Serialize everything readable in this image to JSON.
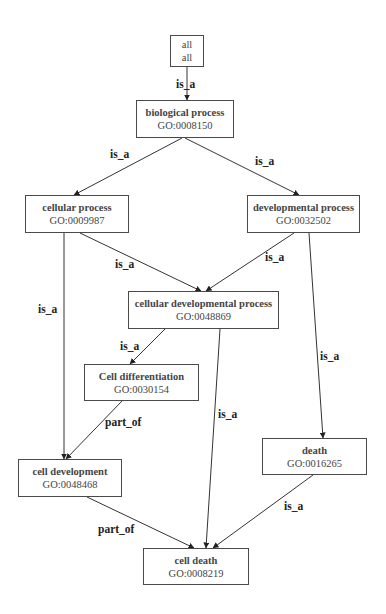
{
  "diagram": {
    "type": "GO term hierarchy graph",
    "nodes": [
      {
        "key": "all",
        "name": "all",
        "id": "all",
        "x": 170,
        "y": 35,
        "w": 34,
        "h": 32
      },
      {
        "key": "biological_process",
        "name": "biological process",
        "id": "GO:0008150",
        "x": 136,
        "y": 100,
        "w": 98,
        "h": 38
      },
      {
        "key": "cellular_process",
        "name": "cellular process",
        "id": "GO:0009987",
        "x": 25,
        "y": 195,
        "w": 104,
        "h": 38
      },
      {
        "key": "developmental_process",
        "name": "developmental process",
        "id": "GO:0032502",
        "x": 247,
        "y": 195,
        "w": 113,
        "h": 38
      },
      {
        "key": "cellular_developmental_process",
        "name": "cellular developmental process",
        "id": "GO:0048869",
        "x": 128,
        "y": 291,
        "w": 151,
        "h": 38
      },
      {
        "key": "cell_differentiation",
        "name": "Cell differentiation",
        "id": "GO:0030154",
        "x": 84,
        "y": 364,
        "w": 115,
        "h": 37
      },
      {
        "key": "cell_development",
        "name": "cell development",
        "id": "GO:0048468",
        "x": 18,
        "y": 459,
        "w": 104,
        "h": 38
      },
      {
        "key": "death",
        "name": "death",
        "id": "GO:0016265",
        "x": 262,
        "y": 438,
        "w": 105,
        "h": 37
      },
      {
        "key": "cell_death",
        "name": "cell death",
        "id": "GO:0008219",
        "x": 143,
        "y": 548,
        "w": 106,
        "h": 37
      }
    ],
    "edges": [
      {
        "from": "all",
        "to": "biological_process",
        "label": "is_a",
        "x1": 187,
        "y1": 67,
        "x2": 187,
        "y2": 100,
        "lx": 176,
        "ly": 78
      },
      {
        "from": "biological_process",
        "to": "cellular_process",
        "label": "is_a",
        "x1": 182,
        "y1": 138,
        "x2": 74,
        "y2": 195,
        "lx": 110,
        "ly": 148
      },
      {
        "from": "biological_process",
        "to": "developmental_process",
        "label": "is_a",
        "x1": 185,
        "y1": 138,
        "x2": 299,
        "y2": 195,
        "lx": 255,
        "ly": 155
      },
      {
        "from": "cellular_process",
        "to": "cellular_developmental_process",
        "label": "is_a",
        "x1": 80,
        "y1": 233,
        "x2": 201,
        "y2": 291,
        "lx": 115,
        "ly": 258
      },
      {
        "from": "developmental_process",
        "to": "cellular_developmental_process",
        "label": "is_a",
        "x1": 294,
        "y1": 233,
        "x2": 206,
        "y2": 291,
        "lx": 265,
        "ly": 251
      },
      {
        "from": "cellular_process",
        "to": "cell_development",
        "label": "is_a",
        "x1": 64,
        "y1": 233,
        "x2": 64,
        "y2": 459,
        "lx": 38,
        "ly": 303
      },
      {
        "from": "cellular_developmental_process",
        "to": "cell_differentiation",
        "label": "is_a",
        "x1": 165,
        "y1": 329,
        "x2": 130,
        "y2": 364,
        "lx": 120,
        "ly": 340
      },
      {
        "from": "developmental_process",
        "to": "death",
        "label": "is_a",
        "x1": 309,
        "y1": 233,
        "x2": 323,
        "y2": 438,
        "lx": 320,
        "ly": 350
      },
      {
        "from": "cell_differentiation",
        "to": "cell_development",
        "label": "part_of",
        "x1": 122,
        "y1": 401,
        "x2": 66,
        "y2": 459,
        "lx": 105,
        "ly": 416
      },
      {
        "from": "cellular_developmental_process",
        "to": "cell_death",
        "label": "is_a",
        "x1": 220,
        "y1": 329,
        "x2": 206,
        "y2": 548,
        "lx": 218,
        "ly": 408
      },
      {
        "from": "cell_development",
        "to": "cell_death",
        "label": "part_of",
        "x1": 87,
        "y1": 497,
        "x2": 194,
        "y2": 548,
        "lx": 98,
        "ly": 523
      },
      {
        "from": "death",
        "to": "cell_death",
        "label": "is_a",
        "x1": 313,
        "y1": 475,
        "x2": 213,
        "y2": 548,
        "lx": 284,
        "ly": 500
      }
    ]
  }
}
